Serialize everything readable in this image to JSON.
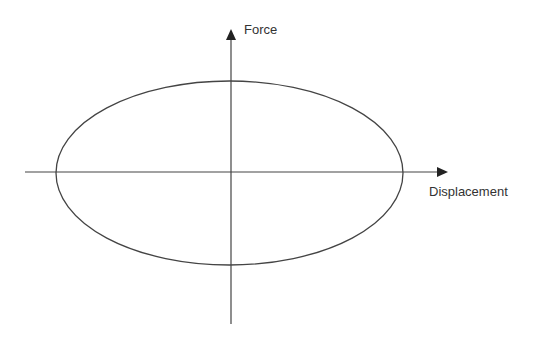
{
  "diagram": {
    "type": "hysteresis-loop",
    "axes": {
      "x": {
        "label": "Displacement"
      },
      "y": {
        "label": "Force"
      }
    },
    "shape": "ellipse",
    "colors": {
      "line": "#333333",
      "background": "#ffffff"
    }
  }
}
